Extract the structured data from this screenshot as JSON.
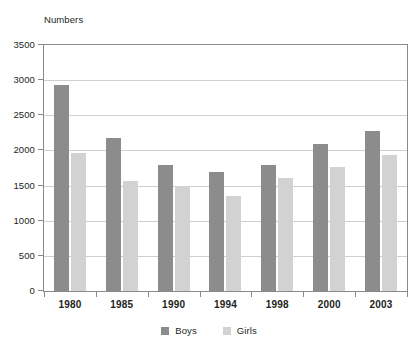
{
  "chart_data": {
    "type": "bar",
    "title": "",
    "subtitle": "",
    "xlabel": "",
    "ylabel": "Numbers",
    "categories": [
      "1980",
      "1985",
      "1990",
      "1994",
      "1998",
      "2000",
      "2003"
    ],
    "series": [
      {
        "name": "Boys",
        "color": "#8c8c8c",
        "values": [
          2930,
          2180,
          1790,
          1690,
          1790,
          2090,
          2280
        ]
      },
      {
        "name": "Girls",
        "color": "#d2d2d2",
        "values": [
          1960,
          1570,
          1500,
          1350,
          1610,
          1760,
          1940
        ]
      }
    ],
    "ylim": [
      0,
      3500
    ],
    "ytick_values": [
      0,
      500,
      1000,
      1500,
      2000,
      2500,
      3000,
      3500
    ],
    "ytick_labels": [
      "0",
      "500",
      "1000",
      "1500",
      "2000",
      "2500",
      "3000",
      "3500"
    ],
    "grid": true,
    "grid_axis": "y",
    "legend_position": "bottom",
    "grouping": "grouped"
  },
  "axis": {
    "y_title": "Numbers"
  },
  "legend": {
    "items": [
      {
        "label": "Boys",
        "color": "#8c8c8c"
      },
      {
        "label": "Girls",
        "color": "#d2d2d2"
      }
    ]
  },
  "style": {
    "frame_color": "#8a8a8a",
    "grid_color": "#cfcfcf",
    "text_color": "#231f20",
    "background": "#ffffff"
  }
}
